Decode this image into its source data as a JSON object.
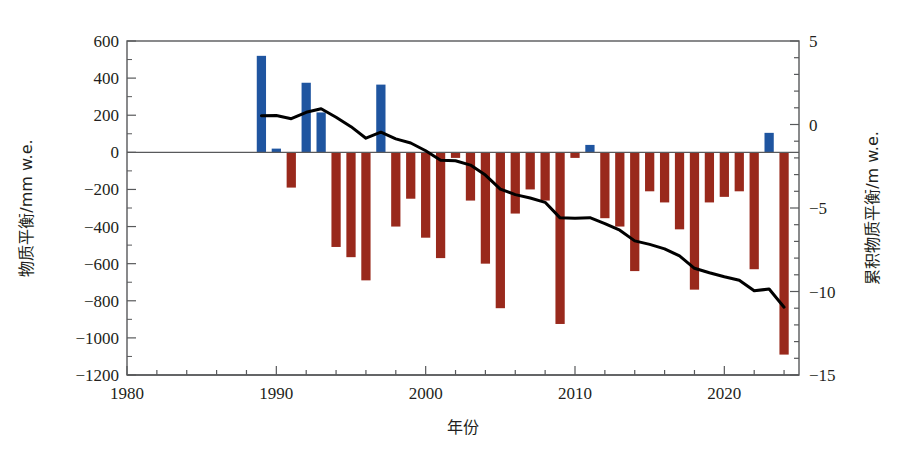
{
  "chart_data": {
    "type": "bar",
    "title": "",
    "xlabel": "年份",
    "ylabel": "物质平衡/mm w.e.",
    "y2label": "累积物质平衡/m w.e.",
    "xlim": [
      1980,
      2025
    ],
    "ylim": [
      -1200,
      600
    ],
    "y2lim": [
      -15,
      5
    ],
    "grid": false,
    "legend": "none",
    "x_ticks": [
      1980,
      1990,
      2000,
      2010,
      2020
    ],
    "x_tick_labels": [
      "1980",
      "1990",
      "2000",
      "2010",
      "2020"
    ],
    "x_minor_step": 2,
    "y_ticks": [
      600,
      400,
      200,
      0,
      -200,
      -400,
      -600,
      -800,
      -1000,
      -1200
    ],
    "y_tick_labels": [
      "600",
      "400",
      "200",
      "0",
      "−200",
      "−400",
      "−600",
      "−800",
      "−1000",
      "−1200"
    ],
    "y2_ticks": [
      5,
      0,
      -5,
      -10,
      -15
    ],
    "y2_tick_labels": [
      "5",
      "0",
      "−5",
      "−10",
      "−15"
    ],
    "y2_minor_step": 1,
    "colors": {
      "positive_bar": "#1f55a0",
      "negative_bar": "#99291c",
      "cumulative_line": "#000000",
      "axis": "#58595b"
    },
    "series": [
      {
        "name": "物质平衡",
        "unit": "mm w.e.",
        "axis": "left",
        "type": "bar",
        "x": [
          1989,
          1990,
          1991,
          1992,
          1993,
          1994,
          1995,
          1996,
          1997,
          1998,
          1999,
          2000,
          2001,
          2002,
          2003,
          2004,
          2005,
          2006,
          2007,
          2008,
          2009,
          2010,
          2011,
          2012,
          2013,
          2014,
          2015,
          2016,
          2017,
          2018,
          2019,
          2020,
          2021,
          2022,
          2023,
          2024
        ],
        "values": [
          520,
          20,
          -190,
          375,
          215,
          -510,
          -565,
          -690,
          365,
          -400,
          -250,
          -460,
          -570,
          -30,
          -260,
          -600,
          -840,
          -330,
          -200,
          -260,
          -925,
          -30,
          40,
          -355,
          -400,
          -640,
          -210,
          -270,
          -415,
          -740,
          -270,
          -240,
          -210,
          -630,
          105,
          -1090
        ]
      },
      {
        "name": "累积物质平衡",
        "unit": "m w.e.",
        "axis": "right",
        "type": "line",
        "x": [
          1989,
          1990,
          1991,
          1992,
          1993,
          1994,
          1995,
          1996,
          1997,
          1998,
          1999,
          2000,
          2001,
          2002,
          2003,
          2004,
          2005,
          2006,
          2007,
          2008,
          2009,
          2010,
          2011,
          2012,
          2013,
          2014,
          2015,
          2016,
          2017,
          2018,
          2019,
          2020,
          2021,
          2022,
          2023,
          2024
        ],
        "values": [
          0.52,
          0.54,
          0.35,
          0.73,
          0.94,
          0.43,
          -0.13,
          -0.82,
          -0.46,
          -0.86,
          -1.11,
          -1.57,
          -2.14,
          -2.17,
          -2.43,
          -3.03,
          -3.87,
          -4.2,
          -4.4,
          -4.66,
          -5.59,
          -5.62,
          -5.58,
          -5.93,
          -6.33,
          -6.97,
          -7.18,
          -7.45,
          -7.87,
          -8.61,
          -8.88,
          -9.12,
          -9.33,
          -9.96,
          -9.85,
          -10.94
        ]
      }
    ]
  }
}
